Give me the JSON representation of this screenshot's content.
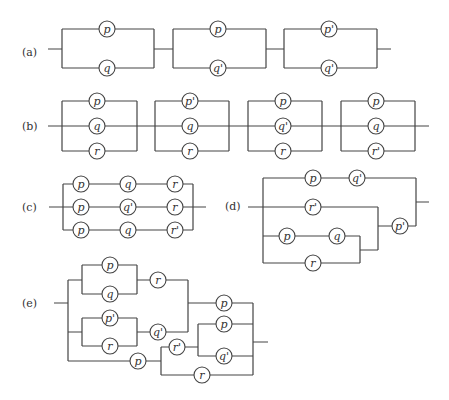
{
  "diagram": {
    "type": "switching-circuits",
    "parts": [
      {
        "id": "a",
        "label": "(a)",
        "description": "Three parallel pairs in series",
        "blocks": [
          {
            "top": "p",
            "bottom": "q"
          },
          {
            "top": "p",
            "bottom": "q'"
          },
          {
            "top": "p'",
            "bottom": "q'"
          }
        ]
      },
      {
        "id": "b",
        "label": "(b)",
        "description": "Four parallel triples in series",
        "blocks": [
          {
            "top": "p",
            "middle": "q",
            "bottom": "r"
          },
          {
            "top": "p'",
            "middle": "q",
            "bottom": "r"
          },
          {
            "top": "p",
            "middle": "q'",
            "bottom": "r"
          },
          {
            "top": "p",
            "middle": "q",
            "bottom": "r'"
          }
        ]
      },
      {
        "id": "c",
        "label": "(c)",
        "description": "Three series branches in parallel",
        "rows": [
          [
            "p",
            "q",
            "r"
          ],
          [
            "p",
            "q'",
            "r"
          ],
          [
            "p",
            "q",
            "r'"
          ]
        ]
      },
      {
        "id": "d",
        "label": "(d)",
        "switches": {
          "top_row": [
            "p",
            "q'"
          ],
          "middle_row": [
            "r'"
          ],
          "inner_top": [
            "p",
            "q"
          ],
          "inner_bottom": [
            "r"
          ],
          "series_switch": "p'"
        }
      },
      {
        "id": "e",
        "label": "(e)",
        "switches": {
          "upper_pair": [
            "p",
            "q"
          ],
          "upper_series": "r",
          "lower_pair": [
            "p'",
            "r"
          ],
          "lower_series": "q'",
          "right_top": "p",
          "bottom_series": "p",
          "mid_series": "r'",
          "inner_pair": [
            "p",
            "q'"
          ],
          "bottom_branch": "r"
        }
      }
    ]
  }
}
